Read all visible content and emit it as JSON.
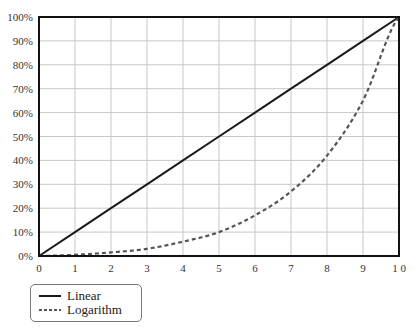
{
  "chart_data": {
    "type": "line",
    "title": "",
    "xlabel": "",
    "ylabel": "",
    "x": [
      0,
      1,
      2,
      3,
      4,
      5,
      6,
      7,
      8,
      9,
      10
    ],
    "xlim": [
      0,
      10
    ],
    "ylim": [
      0,
      100
    ],
    "x_ticks": [
      "0",
      "1",
      "2",
      "3",
      "4",
      "5",
      "6",
      "7",
      "8",
      "9",
      "1 0"
    ],
    "y_ticks": [
      "0%",
      "10%",
      "20%",
      "30%",
      "40%",
      "50%",
      "60%",
      "70%",
      "80%",
      "90%",
      "100%"
    ],
    "grid": true,
    "legend_position": "bottom-left, below plot",
    "series": [
      {
        "name": "Linear",
        "style": "solid",
        "color": "#1a1a1a",
        "values": [
          0,
          10,
          20,
          30,
          40,
          50,
          60,
          70,
          80,
          90,
          100
        ]
      },
      {
        "name": "Logarithm",
        "style": "dashed",
        "color": "#555555",
        "values": [
          0,
          0.5,
          1.5,
          3,
          6,
          10,
          17,
          27,
          42,
          65,
          100
        ]
      }
    ]
  },
  "legend": {
    "items": [
      {
        "label": "Linear",
        "style": "solid"
      },
      {
        "label": "Logarithm",
        "style": "dashed"
      }
    ]
  }
}
